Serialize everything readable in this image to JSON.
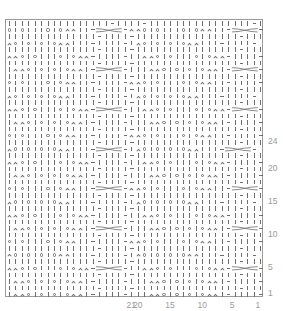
{
  "chart": {
    "type": "knitting-chart",
    "columns": 40,
    "rows_visible": 42,
    "colors": {
      "symbol": "#6e6e6e",
      "border": "#9a9a9a",
      "label": "#9a9a9a",
      "background": "#ffffff"
    },
    "symbol_key": {
      "|": "knit",
      "-": "purl",
      "O": "yarn-over",
      "A": "decrease",
      "X": "cable-4st"
    },
    "row_labels": [
      {
        "text": "24",
        "row": 24
      },
      {
        "text": "20",
        "row": 20
      },
      {
        "text": "15",
        "row": 15
      },
      {
        "text": "10",
        "row": 10
      },
      {
        "text": "5",
        "row": 5
      },
      {
        "text": "1",
        "row": 1
      }
    ],
    "col_labels": [
      {
        "text": "21",
        "col": 21
      },
      {
        "text": "20",
        "col": 20
      },
      {
        "text": "15",
        "col": 15
      },
      {
        "text": "10",
        "col": 10
      },
      {
        "text": "5",
        "col": 5
      },
      {
        "text": "1",
        "col": 1
      }
    ],
    "pattern_rows_top_to_bottom": [
      "||||||||||||||||-||||-||||||||||||||||-||||-",
      "O|O|||O|OAA||-XXXX-AAO|O|||O|OAA||-XXXX-",
      "||||||||||||||-||||-||||||||||||||||-||||-",
      "AO|O|O|OAA|||-||||-|AO|O|O|OAA|||-||||-",
      "||||||||||||||-||||-||||||||||||||||-||||-",
      "AAO|O|||O|OAA-||||-||AAO|O|||O|OAA-||||-",
      "||||||||||||||-||||-||||||||||||||||-||||-",
      "|AAO|O|O|OAA|-XXXX-|||AAO|O|O|OAA|-XXXX-",
      "||||||||||||||-||||-||||||||||||||||-||||-",
      "O|O|||O|OAA||-||||-AAO|O|||O|OAA||-||||-",
      "||||||||||||||-||||-||||||||||||||||-||||-",
      "AO|O|O|OAA|||-||||-|AO|O|O|OAA|||-||||-",
      "||||||||||||||-||||-||||||||||||||||-||||-",
      "AAO|O|||O|OAA-XXXX-||AAO|O|||O|OAA-XXXX-",
      "||||||||||||||-||||-||||||||||||||||-||||-",
      "|AAO|O|O|OAA|-||||-|||AAO|O|O|OAA|-||||-",
      "||||||||||||||-||||-||||||||||||||||-||||-",
      "O|O|||O|OAA||-||||-AAO|O|||O|OAA||-||||-",
      "||||||||||||||-||||-||||||||||||||||-||||-",
      "AO|O|O|OAA|||-XXXX-|AO|O|O|OAA|||-XXXX-",
      "||||||||||||||-||||-||||||||||||||||-||||-",
      "AAO|O|||O|OAA-||||-||AAO|O|||O|OAA-||||-",
      "||||||||||||||-||||-||||||||||||||||-||||-",
      "|AAO|O|O|OAA|-||||-|||AAO|O|O|OAA|-||||-",
      "||||||||||||||-||||-||||||||||||||||-||||-",
      "O|O|||O|OAA||-XXXX-AAO|O|||O|OAA||-XXXX-",
      "||||||||||||||-||||-||||||||||||||||-||||-",
      "AO|O|O|OAA|||-||||-|AO|O|O|OAA|||-||||-",
      "||||||||||||||-||||-||||||||||||||||-||||-",
      "AAO|O|||O|OAA-||||-||AAO|O|||O|OAA-||||-",
      "||||||||||||||-||||-||||||||||||||||-||||-",
      "|AAO|O|O|OAA|-XXXX-|||AAO|O|O|OAA|-XXXX-",
      "||||||||||||||-||||-||||||||||||||||-||||-",
      "O|O|||O|OAA||-||||-AAO|O|||O|OAA||-||||-",
      "||||||||||||||-||||-||||||||||||||||-||||-",
      "AO|O|O|OAA|||-||||-|AO|O|O|OAA|||-||||-",
      "||||||||||||||-||||-||||||||||||||||-||||-",
      "AAO|O|||O|OAA-XXXX-||AAO|O|||O|OAA-XXXX-",
      "||||||||||||||-||||-||||||||||||||||-||||-",
      "|AAO|O|O|OAA|-||||-|||AAO|O|O|OAA|-||||-",
      "||||||||||||||-||||-||||||||||||||||-||||-",
      "|AAO|O|O|OAA|-||||-|||AAO|O|O|OAA|-||||-"
    ]
  }
}
